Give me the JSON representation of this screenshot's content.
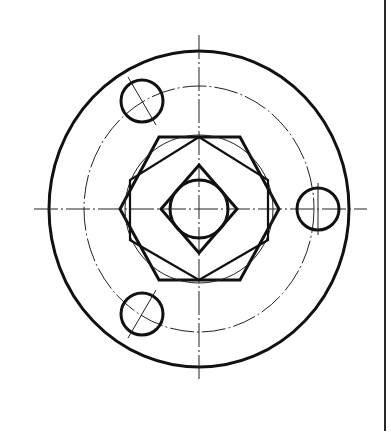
{
  "drawing": {
    "type": "engineering-drawing",
    "view": "top view of flange with hexagonal nut and square bore",
    "stroke_color": "#111111",
    "background": "#ffffff",
    "center": [
      199,
      209
    ],
    "outer_circle": {
      "cx": 199,
      "cy": 209,
      "rx": 150,
      "ry": 158
    },
    "bolt_circle": {
      "cx": 199,
      "cy": 209,
      "rx": 115,
      "ry": 123,
      "style": "dash-dot"
    },
    "holes": [
      {
        "cx": 142,
        "cy": 101,
        "r": 21
      },
      {
        "cx": 318,
        "cy": 209,
        "r": 21
      },
      {
        "cx": 142,
        "cy": 314,
        "r": 21
      }
    ],
    "hexagon": {
      "points": [
        [
          159,
          137
        ],
        [
          240,
          137
        ],
        [
          279,
          209
        ],
        [
          240,
          280
        ],
        [
          159,
          280
        ],
        [
          120,
          209
        ]
      ]
    },
    "hex_inscribed_circle": {
      "cx": 199,
      "cy": 209,
      "r": 72
    },
    "square": {
      "points": [
        [
          199,
          165
        ],
        [
          237,
          209
        ],
        [
          199,
          253
        ],
        [
          161,
          209
        ]
      ]
    },
    "inner_circle": {
      "cx": 199,
      "cy": 209,
      "r": 29
    },
    "centerlines": {
      "vertical": {
        "x": 199,
        "y1": 35,
        "y2": 381
      },
      "horizontal": {
        "y": 209,
        "x1": 34,
        "x2": 367
      }
    },
    "right_border_x": 385
  }
}
